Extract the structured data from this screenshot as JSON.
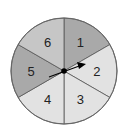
{
  "spinner": {
    "center": [
      64,
      71
    ],
    "radius": 53,
    "outline_color": "#666666",
    "sections": [
      {
        "label": "1",
        "color": "#a9a9a9",
        "start": 0,
        "end": 60
      },
      {
        "label": "2",
        "color": "#e2e2e2",
        "start": 60,
        "end": 120
      },
      {
        "label": "3",
        "color": "#e2e2e2",
        "start": 120,
        "end": 180
      },
      {
        "label": "4",
        "color": "#e2e2e2",
        "start": 180,
        "end": 240
      },
      {
        "label": "5",
        "color": "#a9a9a9",
        "start": 240,
        "end": 300
      },
      {
        "label": "6",
        "color": "#c6c6c6",
        "start": 300,
        "end": 360
      }
    ],
    "arrow": {
      "direction": "pointing toward section 2",
      "color": "#000000"
    }
  }
}
